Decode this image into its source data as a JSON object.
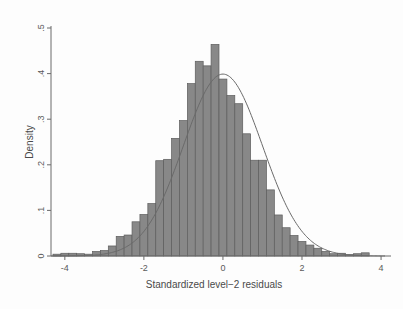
{
  "figure": {
    "background_color": "#fdfdfd",
    "bar_fill_color": "#888888",
    "bar_border_color": "#5d5d5d",
    "curve_color": "#6a6a6a",
    "axis_color": "#6b6b6b"
  },
  "chart_data": {
    "type": "bar",
    "title": "",
    "subtitle": "",
    "xlabel": "Standardized level−2 residuals",
    "ylabel": "Density",
    "xlim": [
      -4.35,
      4.1
    ],
    "ylim": [
      0,
      0.5
    ],
    "xticks": [
      -4,
      -2,
      0,
      2,
      4
    ],
    "xticklabels": [
      "-4",
      "-2",
      "0",
      "2",
      "4"
    ],
    "yticks": [
      0,
      0.1,
      0.2,
      0.3,
      0.4,
      0.5
    ],
    "yticklabels": [
      "0",
      ".1",
      ".2",
      ".3",
      ".4",
      ".5"
    ],
    "grid": false,
    "legend": "none",
    "bin_width": 0.2,
    "categories": [
      "-4.2",
      "-4.0",
      "-3.8",
      "-3.6",
      "-3.4",
      "-3.2",
      "-3.0",
      "-2.8",
      "-2.6",
      "-2.4",
      "-2.2",
      "-2.0",
      "-1.8",
      "-1.6",
      "-1.4",
      "-1.2",
      "-1.0",
      "-0.8",
      "-0.6",
      "-0.4",
      "-0.2",
      "0.0",
      "0.2",
      "0.4",
      "0.6",
      "0.8",
      "1.0",
      "1.2",
      "1.4",
      "1.6",
      "1.8",
      "2.0",
      "2.2",
      "2.4",
      "2.6",
      "2.8",
      "3.0",
      "3.2",
      "3.4",
      "3.6"
    ],
    "values": [
      0.004,
      0.006,
      0.006,
      0.005,
      0.004,
      0.01,
      0.012,
      0.022,
      0.043,
      0.046,
      0.075,
      0.091,
      0.115,
      0.209,
      0.212,
      0.258,
      0.297,
      0.378,
      0.427,
      0.417,
      0.464,
      0.388,
      0.352,
      0.334,
      0.268,
      0.21,
      0.21,
      0.145,
      0.09,
      0.062,
      0.045,
      0.032,
      0.024,
      0.017,
      0.01,
      0.005,
      0.006,
      0.003,
      0.005,
      0.007
    ],
    "overlay": {
      "name": "normal density",
      "type": "line",
      "mean": 0,
      "sd": 1,
      "peak": 0.399
    }
  }
}
